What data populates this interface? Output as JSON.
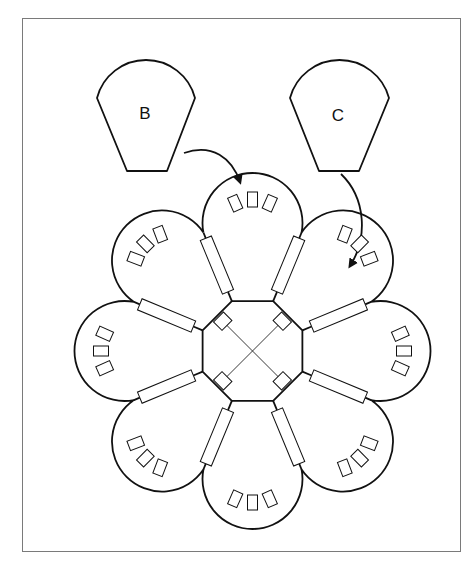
{
  "figure": {
    "frame": {
      "x": 22,
      "y": 18,
      "width": 439,
      "height": 534,
      "border_color": "#7a7a7a"
    },
    "ink_color": "#111111",
    "pieces": [
      {
        "id": "B",
        "label": "B",
        "shoulder_left": [
          97,
          98
        ],
        "shoulder_right": [
          195,
          98
        ],
        "arc_top_y": 60,
        "bottom_left": [
          127,
          171
        ],
        "bottom_right": [
          167,
          171
        ],
        "label_pos": [
          145,
          119
        ]
      },
      {
        "id": "C",
        "label": "C",
        "shoulder_left": [
          290,
          98
        ],
        "shoulder_right": [
          389,
          98
        ],
        "arc_top_y": 60,
        "bottom_left": [
          319,
          171
        ],
        "bottom_right": [
          359,
          171
        ],
        "label_pos": [
          338,
          121
        ]
      }
    ],
    "arrows": [
      {
        "from": "B",
        "path": "M184,153 C212,143 232,158 240,182",
        "head": [
          241,
          186
        ]
      },
      {
        "from": "C",
        "path": "M341,174 C366,198 368,238 350,266",
        "head": [
          346,
          272
        ]
      }
    ],
    "assembly": {
      "center": [
        252.5,
        351
      ],
      "octagon_radius": 54,
      "lobe_count": 8,
      "lobe_center_distance": 109,
      "lobe_radius": 50,
      "tabs_per_lobe": 3,
      "tab_size": [
        10,
        15
      ],
      "tab_angle_spacing_deg": 24,
      "connector_size": [
        58,
        12
      ],
      "corner_square_size": [
        14,
        12
      ],
      "cross_lines": true
    }
  }
}
